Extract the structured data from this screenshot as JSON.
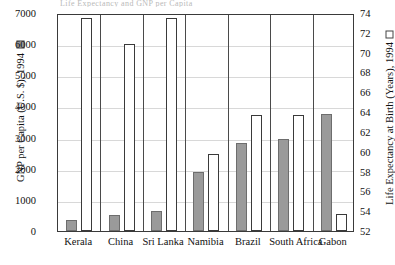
{
  "title_fragment": "Life Expectancy and GNP per Capita",
  "left_axis": {
    "label": "GNP per Capita (U.S. $), 1994",
    "swatch": "filled-gray-square",
    "swatch_color": "#9a9a9a",
    "ticks": [
      0,
      1000,
      2000,
      3000,
      4000,
      5000,
      6000,
      7000
    ],
    "min": 0,
    "max": 7000
  },
  "right_axis": {
    "label": "Life Expectancy at Birth (Years), 1994",
    "swatch": "hollow-white-square",
    "swatch_color": "#ffffff",
    "ticks": [
      52,
      54,
      56,
      58,
      60,
      62,
      64,
      66,
      68,
      70,
      72,
      74
    ],
    "min": 52,
    "max": 74
  },
  "chart_data": {
    "type": "bar",
    "title": "Life Expectancy and GNP per Capita",
    "xlabel": "",
    "ylabel": "GNP per Capita (U.S. $), 1994",
    "ylabel_secondary": "Life Expectancy at Birth (Years), 1994",
    "ylim": [
      0,
      7000
    ],
    "ylim_secondary": [
      52,
      74
    ],
    "grid": true,
    "legend_position": "axis-titles",
    "categories": [
      "Kerala",
      "China",
      "Sri Lanka",
      "Namibia",
      "Brazil",
      "South Africa",
      "Gabon"
    ],
    "series": [
      {
        "name": "GNP per Capita (U.S. $), 1994",
        "axis": "left",
        "color": "#9a9a9a",
        "values": [
          340,
          530,
          640,
          1880,
          2830,
          2970,
          3760
        ]
      },
      {
        "name": "Life Expectancy at Birth (Years), 1994",
        "axis": "right",
        "color": "#ffffff",
        "values": [
          73.5,
          70.9,
          73.5,
          59.8,
          63.7,
          63.7,
          53.7
        ]
      }
    ]
  }
}
